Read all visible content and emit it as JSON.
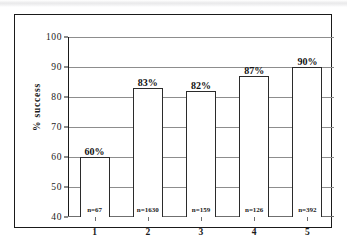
{
  "chart_data": {
    "type": "bar",
    "title": "",
    "xlabel": "",
    "ylabel": "% success",
    "categories": [
      "1",
      "2",
      "3",
      "4",
      "5"
    ],
    "values": [
      60,
      83,
      82,
      87,
      90
    ],
    "value_labels": [
      "60%",
      "83%",
      "82%",
      "87%",
      "90%"
    ],
    "sample_labels": [
      "n=67",
      "n=1630",
      "n=159",
      "n=126",
      "n=392"
    ],
    "sample_sizes": [
      67,
      1630,
      159,
      126,
      392
    ],
    "ylim": [
      40,
      100
    ],
    "ytick_labels": [
      "100",
      "90",
      "80",
      "70",
      "60",
      "50",
      "40"
    ],
    "ytick_values": [
      100,
      90,
      80,
      70,
      60,
      50,
      40
    ],
    "grid": true,
    "legend": false,
    "colors": {
      "bar_fill": "#ffffff",
      "bar_border": "#2b2b2b",
      "gridline": "#8d8d8d",
      "axis": "#1a1a1a",
      "frame": "#1a1a1a",
      "background": "#ffffff"
    }
  }
}
